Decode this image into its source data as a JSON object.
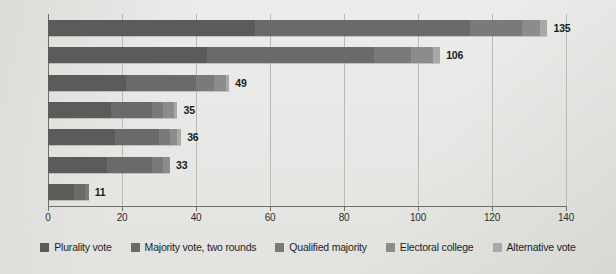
{
  "chart_data": {
    "type": "bar",
    "orientation": "horizontal",
    "stacked": true,
    "title": "",
    "subtitle": "",
    "xlabel": "",
    "ylabel": "",
    "xlim": [
      0,
      140
    ],
    "xticks": [
      0,
      20,
      40,
      60,
      80,
      100,
      120,
      140
    ],
    "xtick_labels": [
      "0",
      "20",
      "40",
      "60",
      "80",
      "100",
      "120",
      "140"
    ],
    "grid": true,
    "grid_axis": "x",
    "legend_position": "bottom",
    "categories": [
      "2000s",
      "1990s",
      "1980s",
      "1970s",
      "1960s",
      "1950s",
      "1940s"
    ],
    "totals": [
      135,
      106,
      49,
      35,
      36,
      33,
      11
    ],
    "total_labels": [
      "135",
      "106",
      "49",
      "35",
      "36",
      "33",
      "11"
    ],
    "series": [
      {
        "name": "Plurality vote",
        "color": "#5b5b59",
        "values": [
          56,
          43,
          21,
          17,
          18,
          16,
          7
        ]
      },
      {
        "name": "Majority vote, two rounds",
        "color": "#6a6a68",
        "values": [
          58,
          45,
          19,
          11,
          12,
          12,
          3
        ]
      },
      {
        "name": "Qualified majority",
        "color": "#7a7a78",
        "values": [
          14,
          10,
          5,
          3,
          3,
          3,
          1
        ]
      },
      {
        "name": "Electoral college",
        "color": "#8c8c8a",
        "values": [
          5,
          6,
          3,
          3,
          2,
          2,
          0
        ]
      },
      {
        "name": "Alternative vote",
        "color": "#a8a8a6",
        "values": [
          2,
          2,
          1,
          1,
          1,
          0,
          0
        ]
      }
    ]
  },
  "legend": {
    "items": [
      {
        "label": "Plurality vote",
        "color": "#5b5b59"
      },
      {
        "label": "Majority vote, two rounds",
        "color": "#6a6a68"
      },
      {
        "label": "Qualified majority",
        "color": "#7a7a78"
      },
      {
        "label": "Electoral college",
        "color": "#8c8c8a"
      },
      {
        "label": "Alternative vote",
        "color": "#a8a8a6"
      }
    ]
  }
}
